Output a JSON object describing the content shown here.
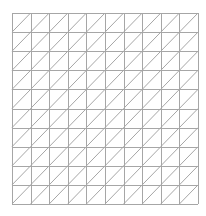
{
  "mesh": {
    "type": "triangulated-grid",
    "columns": 10,
    "rows": 10,
    "diagonal_direction": "bottom-left-to-top-right",
    "bounds": {
      "x0": 12,
      "y0": 13,
      "x1": 198,
      "y1": 204
    },
    "line_color": "#a6a6a6",
    "line_width": 1,
    "background": "#ffffff"
  }
}
